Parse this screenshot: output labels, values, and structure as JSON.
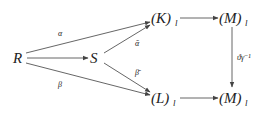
{
  "diagram": {
    "nodes": {
      "R": {
        "label": "R"
      },
      "S": {
        "label": "S"
      },
      "K": {
        "label": "(K)",
        "subscript": "l"
      },
      "M_top": {
        "label": "(M)",
        "subscript": "l"
      },
      "L": {
        "label": "(L)",
        "subscript": "l"
      },
      "M_bottom": {
        "label": "(M)",
        "subscript": "l"
      }
    },
    "edges": {
      "R_to_K": {
        "from": "R",
        "to": "K",
        "label": "α"
      },
      "R_to_S": {
        "from": "R",
        "to": "S",
        "label": ""
      },
      "R_to_L": {
        "from": "R",
        "to": "L",
        "label": "β"
      },
      "S_to_K": {
        "from": "S",
        "to": "K",
        "label": "ᾱ"
      },
      "S_to_L": {
        "from": "S",
        "to": "L",
        "label": "β̄"
      },
      "K_to_M_top": {
        "from": "K",
        "to": "M_top",
        "label": ""
      },
      "L_to_M_bottom": {
        "from": "L",
        "to": "M_bottom",
        "label": ""
      },
      "M_top_to_M_bottom": {
        "from": "M_top",
        "to": "M_bottom",
        "label": "ϑγ⁻¹"
      }
    },
    "colors": {
      "stroke": "#555555",
      "text": "#222222",
      "background": "#ffffff"
    }
  }
}
